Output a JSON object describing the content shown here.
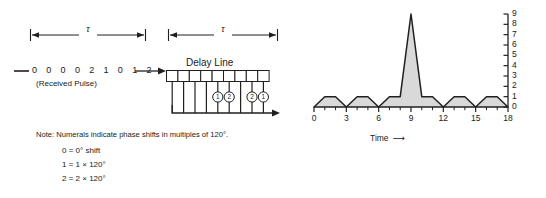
{
  "figure": {
    "colors": {
      "ink": "#231f20",
      "wave_fill": "#d8d8d8",
      "wave_stroke": "#231f20",
      "background": "#ffffff"
    }
  },
  "left_panel": {
    "tau_brackets": [
      {
        "label": "τ",
        "name": "tau-bracket-left"
      },
      {
        "label": "τ",
        "name": "tau-bracket-right"
      }
    ],
    "received_pulse": {
      "digits": "0 0 0 0 2 1 0 1 2",
      "digit_list": [
        "0",
        "0",
        "0",
        "0",
        "2",
        "1",
        "0",
        "1",
        "2"
      ],
      "caption": "(Received Pulse)"
    },
    "delay_line": {
      "title": "Delay Line",
      "cell_count": 9,
      "taps": [
        {
          "index": 1,
          "phase": "",
          "circled": false
        },
        {
          "index": 2,
          "phase": "",
          "circled": false
        },
        {
          "index": 3,
          "phase": "",
          "circled": false
        },
        {
          "index": 4,
          "phase": "",
          "circled": false
        },
        {
          "index": 5,
          "phase": "1",
          "circled": true
        },
        {
          "index": 6,
          "phase": "2",
          "circled": true
        },
        {
          "index": 7,
          "phase": "",
          "circled": false
        },
        {
          "index": 8,
          "phase": "2",
          "circled": true
        },
        {
          "index": 9,
          "phase": "1",
          "circled": true
        }
      ]
    },
    "note": {
      "text": "Note: Numerals indicate phase shifts in multiples of 120°.",
      "legend": [
        "0 = 0° shift",
        "1 = 1 × 120°",
        "2 = 2 × 120°"
      ]
    }
  },
  "chart_data": {
    "type": "area",
    "title": "",
    "xlabel": "Time",
    "ylabel": "",
    "x": [
      0,
      1,
      2,
      3,
      4,
      5,
      6,
      7,
      8,
      9,
      10,
      11,
      12,
      13,
      14,
      15,
      16,
      17,
      18
    ],
    "values": [
      0,
      1,
      1,
      0,
      1,
      1,
      0,
      1,
      1,
      9,
      1,
      1,
      0,
      1,
      1,
      0,
      1,
      1,
      0
    ],
    "xlim": [
      0,
      18
    ],
    "ylim": [
      0,
      9
    ],
    "xticks": [
      0,
      3,
      6,
      9,
      12,
      15,
      18
    ],
    "xtick_labels": [
      "0",
      "3",
      "6",
      "9",
      "12",
      "15",
      "18"
    ],
    "xminor_ticks": [
      1,
      2,
      4,
      5,
      7,
      8,
      10,
      11,
      13,
      14,
      16,
      17
    ],
    "yticks": [
      0,
      1,
      2,
      3,
      4,
      5,
      6,
      7,
      8,
      9
    ],
    "ytick_labels": [
      "0",
      "1",
      "2",
      "3",
      "4",
      "5",
      "6",
      "7",
      "8",
      "9"
    ],
    "y_axis_position": "right",
    "grid": false,
    "legend": false,
    "peak": {
      "x": 9,
      "y": 9
    },
    "sidelobe_level": 1,
    "axis_arrow": "⟶"
  }
}
